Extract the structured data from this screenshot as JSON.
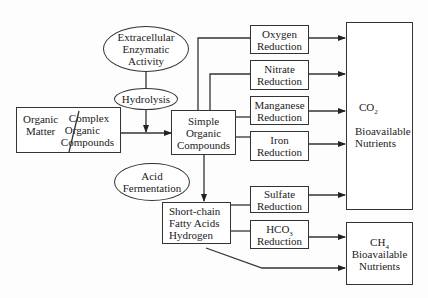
{
  "diagram": {
    "nodes": {
      "extracellular": {
        "lines": [
          "Extracellular",
          "Enzymatic",
          "Activity"
        ]
      },
      "hydrolysis": {
        "label": "Hydrolysis"
      },
      "organic_matter": {
        "left_lines": [
          "Organic",
          "Matter"
        ],
        "right_lines": [
          "Complex",
          "Organic",
          "Compounds"
        ]
      },
      "simple_organic": {
        "lines": [
          "Simple",
          "Organic",
          "Compounds"
        ]
      },
      "acid_fermentation": {
        "lines": [
          "Acid",
          "Fermentation"
        ]
      },
      "short_chain": {
        "lines": [
          "Short-chain",
          "Fatty Acids",
          "Hydrogen"
        ]
      },
      "oxygen": {
        "lines": [
          "Oxygen",
          "Reduction"
        ]
      },
      "nitrate": {
        "lines": [
          "Nitrate",
          "Reduction"
        ]
      },
      "manganese": {
        "lines": [
          "Manganese",
          "Reduction"
        ]
      },
      "iron": {
        "lines": [
          "Iron",
          "Reduction"
        ]
      },
      "sulfate": {
        "lines": [
          "Sulfate",
          "Reduction"
        ]
      },
      "hco3": {
        "formula": "HCO",
        "sub": "3",
        "line2": "Reduction"
      },
      "co2": {
        "formula": "CO",
        "sub": "2",
        "lines": [
          "Bioavailable",
          "Nutrients"
        ]
      },
      "ch4": {
        "formula": "CH",
        "sub": "4",
        "lines": [
          "Bioavailable",
          "Nutrients"
        ]
      }
    }
  }
}
